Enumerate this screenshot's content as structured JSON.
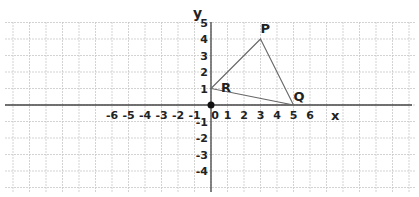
{
  "diagram": {
    "type": "coordinate-plane",
    "axes": {
      "x_label": "x",
      "y_label": "y",
      "x_ticks": [
        "-6",
        "-5",
        "-4",
        "-3",
        "-2",
        "-1",
        "0",
        "1",
        "2",
        "3",
        "4",
        "5",
        "6"
      ],
      "y_ticks": [
        "5",
        "4",
        "3",
        "2",
        "1",
        "-1",
        "-2",
        "-3",
        "-4"
      ]
    },
    "points": [
      {
        "name": "P",
        "x": 3,
        "y": 4
      },
      {
        "name": "Q",
        "x": 5,
        "y": 0
      },
      {
        "name": "R",
        "x": 0,
        "y": 1
      }
    ],
    "origin_marker": "filled-dot",
    "shape": "triangle PQR",
    "colors": {
      "grid": "#c8c8c8",
      "axis": "#444444",
      "triangle": "#666666",
      "text": "#222222"
    }
  }
}
